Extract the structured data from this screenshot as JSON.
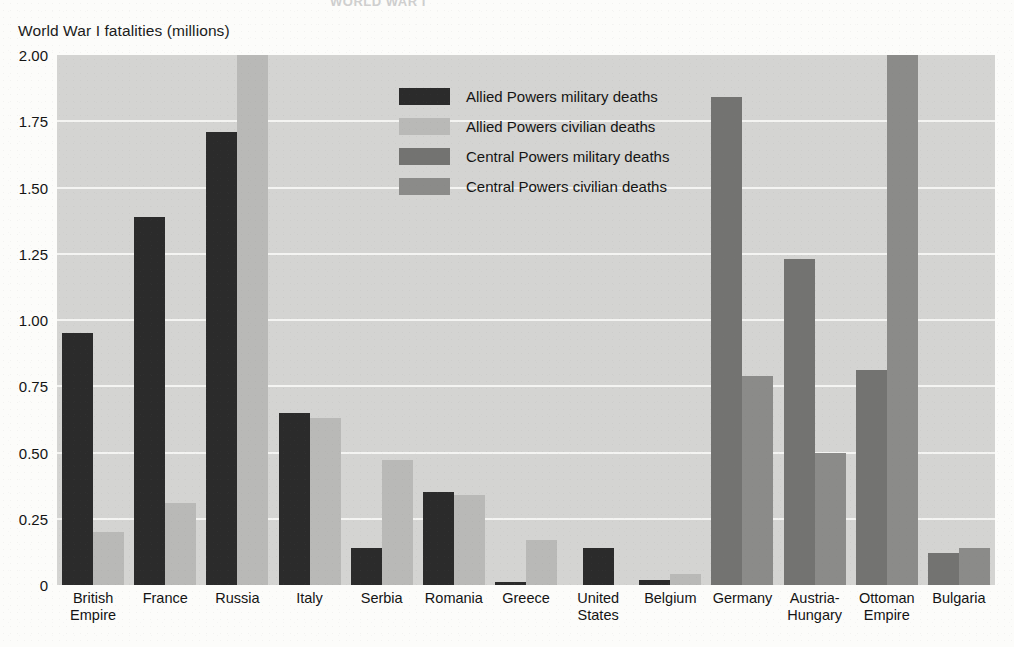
{
  "cut_title": "WORLD WAR I",
  "axis_caption": "World War I fatalities (millions)",
  "legend": {
    "items": [
      {
        "label": "Allied Powers military deaths",
        "color": "#2b2b2b"
      },
      {
        "label": "Allied Powers civilian deaths",
        "color": "#b9b9b7"
      },
      {
        "label": "Central Powers military deaths",
        "color": "#737371"
      },
      {
        "label": "Central Powers civilian deaths",
        "color": "#8b8b89"
      }
    ]
  },
  "chart_data": {
    "type": "bar",
    "title": "World War I fatalities (millions)",
    "xlabel": "",
    "ylabel": "World War I fatalities (millions)",
    "ylim": [
      0,
      2.0
    ],
    "yticks": [
      "0",
      "0.25",
      "0.50",
      "0.75",
      "1.00",
      "1.25",
      "1.50",
      "1.75",
      "2.00"
    ],
    "ytick_values": [
      0,
      0.25,
      0.5,
      0.75,
      1.0,
      1.25,
      1.5,
      1.75,
      2.0
    ],
    "grid": true,
    "legend_position": "inside upper-center",
    "categories": [
      "British Empire",
      "France",
      "Russia",
      "Italy",
      "Serbia",
      "Romania",
      "Greece",
      "United States",
      "Belgium",
      "Germany",
      "Austria-Hungary",
      "Ottoman Empire",
      "Bulgaria"
    ],
    "category_lines": [
      [
        "British",
        "Empire"
      ],
      [
        "France"
      ],
      [
        "Russia"
      ],
      [
        "Italy"
      ],
      [
        "Serbia"
      ],
      [
        "Romania"
      ],
      [
        "Greece"
      ],
      [
        "United",
        "States"
      ],
      [
        "Belgium"
      ],
      [
        "Germany"
      ],
      [
        "Austria-",
        "Hungary"
      ],
      [
        "Ottoman",
        "Empire"
      ],
      [
        "Bulgaria"
      ]
    ],
    "series": [
      {
        "name": "Allied Powers military deaths",
        "color": "#2b2b2b",
        "values": [
          0.95,
          1.39,
          1.71,
          0.65,
          0.14,
          0.35,
          0.01,
          0.14,
          0.02,
          0,
          0,
          0,
          0
        ]
      },
      {
        "name": "Allied Powers civilian deaths",
        "color": "#b9b9b7",
        "values": [
          0.2,
          0.31,
          2.0,
          0.63,
          0.47,
          0.34,
          0.17,
          0,
          0.04,
          0,
          0,
          0,
          0
        ]
      },
      {
        "name": "Central Powers military deaths",
        "color": "#737371",
        "values": [
          0,
          0,
          0,
          0,
          0,
          0,
          0,
          0,
          0,
          1.84,
          1.23,
          0.81,
          0.12
        ]
      },
      {
        "name": "Central Powers civilian deaths",
        "color": "#8b8b89",
        "values": [
          0,
          0,
          0,
          0,
          0,
          0,
          0,
          0,
          0,
          0.79,
          0.5,
          2.02,
          0.14
        ]
      }
    ]
  }
}
